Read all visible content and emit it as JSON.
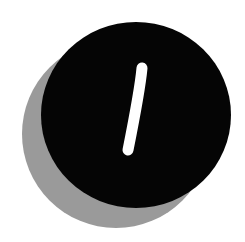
{
  "graphic": {
    "description": "Black circular badge with white slash mark and gray offset shadow",
    "symbol": "slash",
    "colors": {
      "disc": "#050505",
      "shadow": "#9a9a9a",
      "mark": "#ffffff",
      "background": "#ffffff"
    }
  }
}
